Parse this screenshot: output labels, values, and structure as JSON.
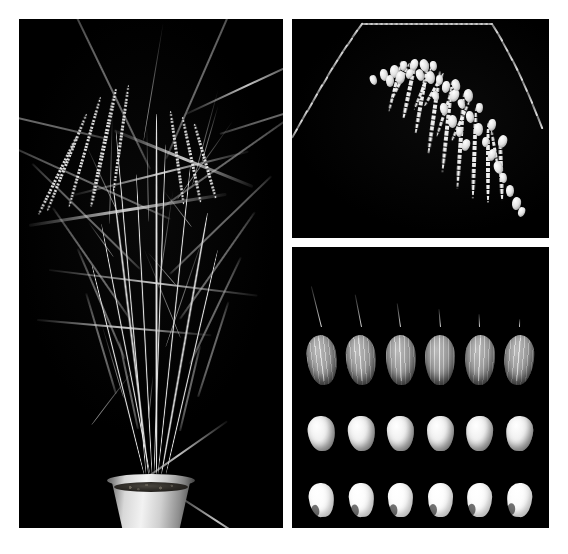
{
  "figure": {
    "background_color": "#ffffff",
    "panel_background_color": "#000000",
    "width_px": 568,
    "height_px": 554,
    "panel_count": 3
  },
  "panels": [
    {
      "id": "panel-plant",
      "name": "whole-plant-panel",
      "subject": "rice plant in pot",
      "position": "left",
      "x": 19,
      "y": 19,
      "width": 264,
      "height": 509,
      "contents": {
        "pot": {
          "name": "plant-pot",
          "color": "#e8e8e8",
          "soil_color": "#2a2723"
        },
        "description": "Mature rice plant with multiple tillers, long drooping leaf blades and several seed-bearing panicles",
        "tiller_count": 9,
        "panicle_count": 4
      }
    },
    {
      "id": "panel-panicle",
      "name": "panicle-panel",
      "subject": "single rice panicle",
      "position": "top-right",
      "x": 292,
      "y": 19,
      "width": 257,
      "height": 219,
      "contents": {
        "description": "Arching rice panicle with pendulous primary branches bearing filled spikelets",
        "branch_count": 9
      }
    },
    {
      "id": "panel-grains",
      "name": "grain-panel",
      "subject": "rice grain series",
      "position": "bottom-right",
      "x": 292,
      "y": 247,
      "width": 257,
      "height": 281,
      "rows": [
        {
          "id": "row-hulled",
          "name": "hulled-grain-row",
          "label": "Hulled grains with awns",
          "count": 6,
          "grain_class": "hulled",
          "tone": "#b4b4b4",
          "awns": [
            42,
            33,
            24,
            18,
            13,
            8
          ]
        },
        {
          "id": "row-brown",
          "name": "brown-rice-row",
          "label": "Dehulled brown rice",
          "count": 6,
          "grain_class": "brown",
          "tone": "#e6e6e6",
          "awns": [
            0,
            0,
            0,
            0,
            0,
            0
          ]
        },
        {
          "id": "row-milled",
          "name": "milled-rice-row",
          "label": "Polished milled rice",
          "count": 6,
          "grain_class": "milled",
          "tone": "#fbfbfb",
          "awns": [
            0,
            0,
            0,
            0,
            0,
            0
          ]
        }
      ]
    }
  ]
}
